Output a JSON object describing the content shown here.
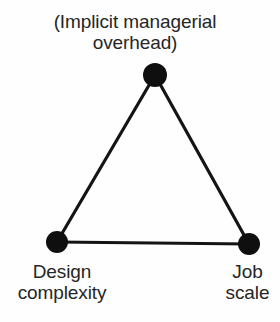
{
  "diagram": {
    "type": "triangle-relationship-diagram",
    "background_color": "#fefefe",
    "edge_color": "#141414",
    "node_color": "#0f0f0f",
    "text_color": "#262626",
    "nodes": [
      {
        "id": "apex",
        "name": "implicit-managerial-overhead",
        "label": "(Implicit managerial\noverhead)",
        "label_position": "above",
        "cx": 155,
        "cy": 75,
        "r": 12
      },
      {
        "id": "bottom-left",
        "name": "design-complexity",
        "label": "Design\ncomplexity",
        "label_position": "below",
        "cx": 57,
        "cy": 242,
        "r": 11
      },
      {
        "id": "bottom-right",
        "name": "job-scale",
        "label": "Job\nscale",
        "label_position": "below",
        "cx": 249,
        "cy": 244,
        "r": 11
      }
    ],
    "edges": [
      {
        "name": "edge-apex-to-design-complexity",
        "from": "apex",
        "to": "bottom-left"
      },
      {
        "name": "edge-apex-to-job-scale",
        "from": "apex",
        "to": "bottom-right"
      },
      {
        "name": "edge-design-complexity-to-job-scale",
        "from": "bottom-left",
        "to": "bottom-right"
      }
    ],
    "edge_width": 3.2
  }
}
